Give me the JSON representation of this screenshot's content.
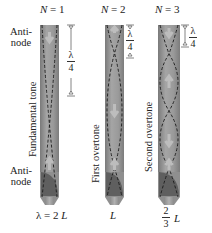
{
  "figure": {
    "pipe_colors": {
      "body": "#8c8c8c",
      "body_light": "#a8a8a8",
      "node_dash": "#1a1a1a",
      "arrow": "#b5b5b5",
      "mouthpiece": "#9a9a9a",
      "mouthpiece_dark": "#5e5e5e"
    },
    "side_labels": {
      "top_antinode": "Anti-\nnode",
      "top_antinode_line1": "Anti-",
      "top_antinode_line2": "node",
      "bottom_antinode_line1": "Anti-",
      "bottom_antinode_line2": "node"
    },
    "pipes": [
      {
        "n_label": "N",
        "n_eq": "= 1",
        "mode_label": "Fundamental tone",
        "quarter_wave_numerator": "λ",
        "quarter_wave_denominator": "4",
        "length_label_prefix": "λ = 2",
        "length_label_var": "L"
      },
      {
        "n_label": "N",
        "n_eq": "= 2",
        "mode_label": "First overtone",
        "quarter_wave_numerator": "λ",
        "quarter_wave_denominator": "4",
        "length_label_var": "L"
      },
      {
        "n_label": "N",
        "n_eq": "= 3",
        "mode_label": "Second overtone",
        "quarter_wave_numerator": "λ",
        "quarter_wave_denominator": "4",
        "length_frac_numerator": "2",
        "length_frac_denominator": "3",
        "length_label_var": "L"
      }
    ]
  }
}
